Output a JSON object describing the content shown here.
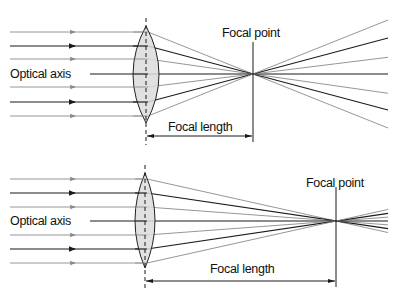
{
  "figure": {
    "colors": {
      "gray_ray": "#8a8a8a",
      "black_ray": "#1a1a1a",
      "lens_fill": "#dcdcdc",
      "lens_stroke": "#222222"
    },
    "panels": [
      {
        "id": "short-focal",
        "optical_axis_label": "Optical axis",
        "focal_point_label": "Focal point",
        "focal_length_label": "Focal length",
        "lens_x": 146,
        "lens_top": 26,
        "lens_bottom": 123,
        "lens_half_width": 13,
        "axis_y": 74,
        "focal_x": 253,
        "rays_y": [
          32,
          46,
          59,
          74,
          87,
          102,
          116
        ],
        "ray_styles": [
          "gray",
          "black",
          "gray",
          "axis",
          "gray",
          "black",
          "gray"
        ]
      },
      {
        "id": "long-focal",
        "optical_axis_label": "Optical axis",
        "focal_point_label": "Focal point",
        "focal_length_label": "Focal length",
        "lens_x": 145,
        "lens_top": 173,
        "lens_bottom": 268,
        "lens_half_width": 10,
        "axis_y": 221,
        "focal_x": 336,
        "rays_y": [
          179,
          193,
          207,
          221,
          235,
          249,
          263
        ],
        "ray_styles": [
          "gray",
          "black",
          "gray",
          "axis",
          "gray",
          "black",
          "gray"
        ]
      }
    ]
  }
}
